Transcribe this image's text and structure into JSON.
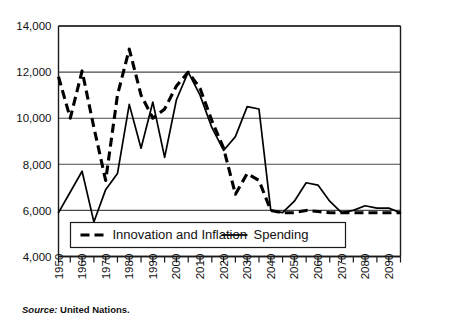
{
  "source_note": {
    "prefix": "Source:",
    "text": "United Nations."
  },
  "legend": {
    "items": [
      {
        "label": "Innovation and Inflation",
        "style": "dashed"
      },
      {
        "label": "Spending",
        "style": "solid"
      }
    ]
  },
  "chart_data": {
    "type": "line",
    "title": "",
    "subtitle": "",
    "xlabel": "",
    "ylabel": "",
    "xlim": [
      1950,
      2095
    ],
    "ylim": [
      4000,
      14000
    ],
    "ytick_step": 2000,
    "xtick_step": 5,
    "xlabel_step": 10,
    "grid": true,
    "legend_position": "bottom-inside",
    "ytick_labels": [
      "4,000",
      "6,000",
      "8,000",
      "10,000",
      "12,000",
      "14,000"
    ],
    "ytick_values": [
      4000,
      6000,
      8000,
      10000,
      12000,
      14000
    ],
    "xtick_labels": [
      "1950",
      "1960",
      "1970",
      "1980",
      "1990",
      "2000",
      "2010",
      "2020",
      "2030",
      "2040",
      "2050",
      "2060",
      "2070",
      "2080",
      "2090"
    ],
    "xtick_values": [
      1950,
      1960,
      1970,
      1980,
      1990,
      2000,
      2010,
      2020,
      2030,
      2040,
      2050,
      2060,
      2070,
      2080,
      2090
    ],
    "x": [
      1950,
      1955,
      1960,
      1965,
      1970,
      1975,
      1980,
      1985,
      1990,
      1995,
      2000,
      2005,
      2010,
      2015,
      2020,
      2025,
      2030,
      2035,
      2040,
      2045,
      2050,
      2055,
      2060,
      2065,
      2070,
      2075,
      2080,
      2085,
      2090,
      2095
    ],
    "series": [
      {
        "name": "Innovation and Inflation",
        "style": "dashed",
        "values": [
          11800,
          10000,
          12050,
          9600,
          7300,
          11000,
          13000,
          11000,
          10000,
          10400,
          11400,
          12000,
          11300,
          9900,
          8700,
          6700,
          7600,
          7300,
          6000,
          5900,
          5900,
          6000,
          5950,
          5900,
          5900,
          5900,
          5900,
          5900,
          5900,
          5900
        ]
      },
      {
        "name": "Spending",
        "style": "solid",
        "values": [
          5900,
          6800,
          7700,
          5500,
          6900,
          7600,
          10600,
          8700,
          10700,
          8300,
          10800,
          12000,
          11000,
          9600,
          8600,
          9200,
          10500,
          10400,
          6000,
          5900,
          6400,
          7200,
          7100,
          6400,
          5900,
          6000,
          6200,
          6100,
          6100,
          5900
        ]
      }
    ]
  }
}
